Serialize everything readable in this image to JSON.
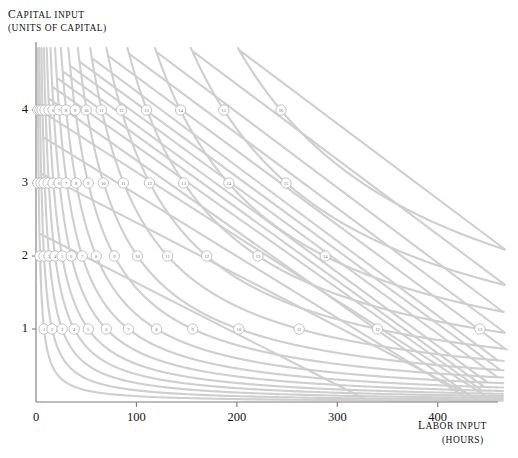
{
  "chart_data": {
    "type": "line",
    "title": "",
    "ylabel": "CAPITAL INPUT",
    "ylabel_units": "(UNITS OF CAPITAL)",
    "xlabel": "LABOR INPUT",
    "xlabel_units": "(HOURS)",
    "xlim": [
      0,
      460
    ],
    "ylim": [
      0,
      4.85
    ],
    "xticks": [
      "0",
      "100",
      "200",
      "300",
      "400"
    ],
    "xtick_values": [
      0,
      100,
      200,
      300,
      400
    ],
    "yticks": [
      "1",
      "2",
      "3",
      "4"
    ],
    "ytick_values": [
      1,
      2,
      3,
      4
    ],
    "grid": false,
    "legend": null,
    "curve_color": "#cfcfcf",
    "axis_color": "#7a7a7a",
    "series_description": "Sixteen isoquant curves of the form capital x labor = constant, each labeled by a small circled number where it crosses capital levels 1, 2, 3 and 4.",
    "series": [
      {
        "name": "1",
        "constant": 8
      },
      {
        "name": "2",
        "constant": 16
      },
      {
        "name": "3",
        "constant": 26
      },
      {
        "name": "4",
        "constant": 38
      },
      {
        "name": "5",
        "constant": 52
      },
      {
        "name": "6",
        "constant": 70
      },
      {
        "name": "7",
        "constant": 92
      },
      {
        "name": "8",
        "constant": 120
      },
      {
        "name": "9",
        "constant": 156
      },
      {
        "name": "10",
        "constant": 202
      },
      {
        "name": "11",
        "constant": 262
      },
      {
        "name": "12",
        "constant": 340
      },
      {
        "name": "13",
        "constant": 442
      },
      {
        "name": "14",
        "constant": 575
      },
      {
        "name": "15",
        "constant": 748
      },
      {
        "name": "16",
        "constant": 975
      }
    ],
    "markers": [
      {
        "label": "1",
        "capital": 4,
        "labor": 2
      },
      {
        "label": "2",
        "capital": 4,
        "labor": 4
      },
      {
        "label": "3",
        "capital": 4,
        "labor": 6
      },
      {
        "label": "4",
        "capital": 4,
        "labor": 9
      },
      {
        "label": "5",
        "capital": 4,
        "labor": 13
      },
      {
        "label": "6",
        "capital": 4,
        "labor": 17
      },
      {
        "label": "7",
        "capital": 4,
        "labor": 23
      },
      {
        "label": "8",
        "capital": 4,
        "labor": 30
      },
      {
        "label": "9",
        "capital": 4,
        "labor": 39
      },
      {
        "label": "10",
        "capital": 4,
        "labor": 50
      },
      {
        "label": "11",
        "capital": 4,
        "labor": 65
      },
      {
        "label": "12",
        "capital": 4,
        "labor": 85
      },
      {
        "label": "13",
        "capital": 4,
        "labor": 110
      },
      {
        "label": "14",
        "capital": 4,
        "labor": 144
      },
      {
        "label": "15",
        "capital": 4,
        "labor": 187
      },
      {
        "label": "16",
        "capital": 4,
        "labor": 244
      },
      {
        "label": "1",
        "capital": 3,
        "labor": 2
      },
      {
        "label": "2",
        "capital": 3,
        "labor": 5
      },
      {
        "label": "3",
        "capital": 3,
        "labor": 8
      },
      {
        "label": "4",
        "capital": 3,
        "labor": 12
      },
      {
        "label": "5",
        "capital": 3,
        "labor": 17
      },
      {
        "label": "6",
        "capital": 3,
        "labor": 23
      },
      {
        "label": "7",
        "capital": 3,
        "labor": 30
      },
      {
        "label": "8",
        "capital": 3,
        "labor": 40
      },
      {
        "label": "9",
        "capital": 3,
        "labor": 52
      },
      {
        "label": "10",
        "capital": 3,
        "labor": 67
      },
      {
        "label": "11",
        "capital": 3,
        "labor": 87
      },
      {
        "label": "12",
        "capital": 3,
        "labor": 113
      },
      {
        "label": "13",
        "capital": 3,
        "labor": 147
      },
      {
        "label": "14",
        "capital": 3,
        "labor": 192
      },
      {
        "label": "15",
        "capital": 3,
        "labor": 249
      },
      {
        "label": "1",
        "capital": 2,
        "labor": 4
      },
      {
        "label": "2",
        "capital": 2,
        "labor": 8
      },
      {
        "label": "3",
        "capital": 2,
        "labor": 13
      },
      {
        "label": "4",
        "capital": 2,
        "labor": 19
      },
      {
        "label": "5",
        "capital": 2,
        "labor": 26
      },
      {
        "label": "6",
        "capital": 2,
        "labor": 35
      },
      {
        "label": "7",
        "capital": 2,
        "labor": 46
      },
      {
        "label": "8",
        "capital": 2,
        "labor": 60
      },
      {
        "label": "9",
        "capital": 2,
        "labor": 78
      },
      {
        "label": "10",
        "capital": 2,
        "labor": 101
      },
      {
        "label": "11",
        "capital": 2,
        "labor": 131
      },
      {
        "label": "12",
        "capital": 2,
        "labor": 170
      },
      {
        "label": "13",
        "capital": 2,
        "labor": 221
      },
      {
        "label": "14",
        "capital": 2,
        "labor": 288
      },
      {
        "label": "1",
        "capital": 1,
        "labor": 8
      },
      {
        "label": "2",
        "capital": 1,
        "labor": 16
      },
      {
        "label": "3",
        "capital": 1,
        "labor": 26
      },
      {
        "label": "4",
        "capital": 1,
        "labor": 38
      },
      {
        "label": "5",
        "capital": 1,
        "labor": 52
      },
      {
        "label": "6",
        "capital": 1,
        "labor": 70
      },
      {
        "label": "7",
        "capital": 1,
        "labor": 92
      },
      {
        "label": "8",
        "capital": 1,
        "labor": 120
      },
      {
        "label": "9",
        "capital": 1,
        "labor": 156
      },
      {
        "label": "10",
        "capital": 1,
        "labor": 202
      },
      {
        "label": "11",
        "capital": 1,
        "labor": 262
      },
      {
        "label": "12",
        "capital": 1,
        "labor": 340
      },
      {
        "label": "13",
        "capital": 1,
        "labor": 442
      }
    ]
  }
}
